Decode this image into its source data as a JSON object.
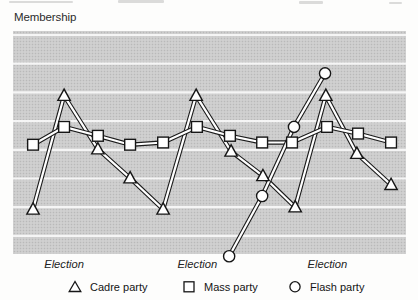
{
  "chart_data": {
    "type": "line",
    "title": "Membership",
    "xlabel": "",
    "ylabel": "Membership",
    "ylim": [
      0,
      100
    ],
    "grid": true,
    "legend_position": "bottom",
    "series": [
      {
        "name": "Cadre party",
        "marker": "triangle",
        "x": [
          5.1,
          13.0,
          21.6,
          29.8,
          38.2,
          46.6,
          55.5,
          63.6,
          71.8,
          79.6,
          87.5,
          96.2
        ],
        "y": [
          20,
          71,
          47,
          34,
          20,
          71,
          46,
          35,
          21,
          71,
          45,
          31
        ]
      },
      {
        "name": "Mass party",
        "marker": "square",
        "x": [
          5.1,
          13.0,
          21.6,
          29.8,
          38.2,
          46.8,
          55.2,
          63.4,
          71.0,
          79.9,
          87.8,
          96.2
        ],
        "y": [
          49,
          57,
          53,
          49,
          50,
          57,
          53,
          50,
          50,
          57,
          54,
          50
        ]
      },
      {
        "name": "Flash party",
        "marker": "circle",
        "x": [
          55.0,
          63.4,
          71.5,
          79.4
        ],
        "y": [
          -1,
          26,
          57,
          81
        ]
      }
    ],
    "annotations": [
      {
        "label": "Election",
        "x": 13.0
      },
      {
        "label": "Election",
        "x": 46.9
      },
      {
        "label": "Election",
        "x": 80.0
      }
    ],
    "layout": {
      "plot": {
        "left": 13,
        "top": 31,
        "width": 393,
        "height": 223
      },
      "gridlines": {
        "count": 8,
        "top": 35,
        "spacing": 28.7
      },
      "colors": {
        "line": "#1b1b1b",
        "line_core": "#ffffff",
        "marker_fill": "#ffffff",
        "marker_stroke": "#161616",
        "plot_bg": "#cbcbcb",
        "gridline": "#f5f5f5"
      }
    }
  },
  "legend": {
    "items": [
      {
        "label": "Cadre party",
        "marker": "triangle"
      },
      {
        "label": "Mass party",
        "marker": "square"
      },
      {
        "label": "Flash party",
        "marker": "circle"
      }
    ]
  }
}
